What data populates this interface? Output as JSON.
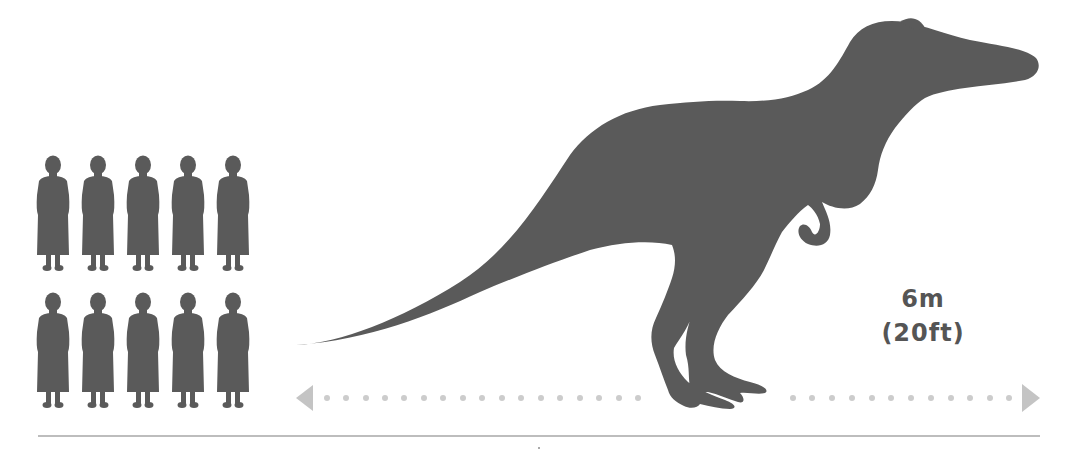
{
  "figure": {
    "length_label": {
      "metric": "6m",
      "imperial": "(20ft)"
    },
    "scale_reference": {
      "icon": "standing-person-silhouette",
      "rows": 2,
      "columns": 5,
      "count": 10
    }
  },
  "colors": {
    "silhouette": "#5a5a5a",
    "arrow": "#c4c4c4",
    "dots": "#cccccc",
    "ground_line": "#bdbdbd",
    "label_text": "#555555",
    "background": "#ffffff"
  },
  "measure": {
    "arrow_left_x": 296,
    "arrow_right_x": 1040,
    "arrow_y": 398
  }
}
